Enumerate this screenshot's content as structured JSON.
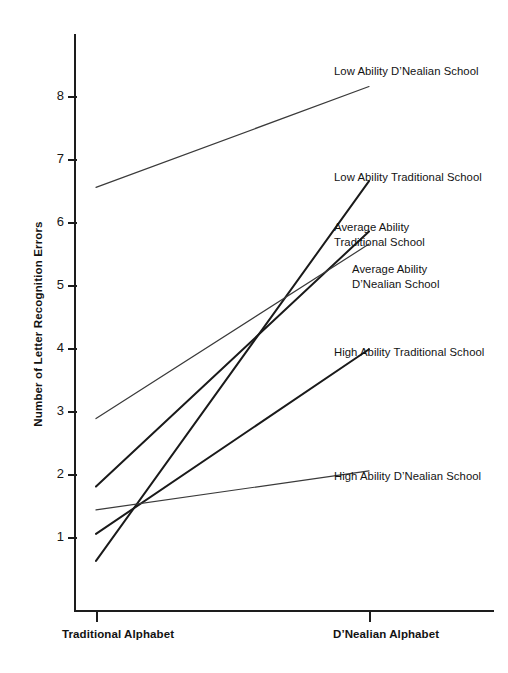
{
  "chart_data": {
    "type": "line",
    "title": "",
    "xlabel": "",
    "ylabel": "Number of Letter Recognition Errors",
    "categories": [
      "Traditional Alphabet",
      "D'Nealian Alphabet"
    ],
    "ylim": [
      0,
      8.7
    ],
    "yticks": [
      1,
      2,
      3,
      4,
      5,
      6,
      7,
      8
    ],
    "ytick_labels": [
      "1",
      "2",
      "3",
      "4",
      "5",
      "6",
      "7",
      "8"
    ],
    "grid": false,
    "legend": "inline-annotations",
    "series": [
      {
        "name": "Low Ability D’Nealian School",
        "values": [
          6.55,
          8.15
        ],
        "color": "#3a3a3a",
        "width": 1.2
      },
      {
        "name": "Low Ability Traditional School",
        "values": [
          0.62,
          6.65
        ],
        "color": "#1a1a1a",
        "width": 2.0
      },
      {
        "name": "Average Ability\nTraditional School",
        "values": [
          1.8,
          5.85
        ],
        "color": "#1a1a1a",
        "width": 2.0
      },
      {
        "name": "Average Ability\nD’Nealian School",
        "values": [
          2.88,
          5.65
        ],
        "color": "#3a3a3a",
        "width": 1.2
      },
      {
        "name": "High Ability Traditional School",
        "values": [
          1.05,
          3.98
        ],
        "color": "#1a1a1a",
        "width": 2.0
      },
      {
        "name": "High Ability D’Nealian School",
        "values": [
          1.43,
          2.05
        ],
        "color": "#3a3a3a",
        "width": 1.2
      }
    ],
    "annotations": [
      {
        "text": "Low Ability D’Nealian School"
      },
      {
        "text": "Low Ability Traditional School"
      },
      {
        "text": "Average Ability\nTraditional School"
      },
      {
        "text": "Average Ability\nD’Nealian School"
      },
      {
        "text": "High Ability Traditional School"
      },
      {
        "text": "High Ability D’Nealian School"
      }
    ]
  },
  "axis": {
    "y_title": "Number of Letter Recognition Errors",
    "y_labels": [
      "8",
      "7",
      "6",
      "5",
      "4",
      "3",
      "2",
      "1"
    ],
    "x_label_left": "Traditional Alphabet",
    "x_label_right": "D’Nealian Alphabet"
  },
  "colors": {
    "axis": "#1d1d1d",
    "line_dark": "#1a1a1a",
    "line_gray": "#3a3a3a",
    "background": "#ffffff",
    "text": "#131313"
  }
}
